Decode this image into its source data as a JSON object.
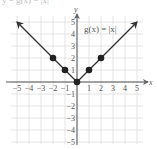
{
  "header": {
    "cropped_text": "y = g(x) = |x|"
  },
  "chart_data": {
    "type": "line",
    "title": "",
    "function_label": "g(x) = |x|",
    "xlabel": "x",
    "ylabel": "y",
    "xlim": [
      -5,
      5
    ],
    "ylim": [
      -5,
      5
    ],
    "grid": true,
    "x_ticks": [
      -5,
      -4,
      -3,
      -2,
      -1,
      1,
      2,
      3,
      4,
      5
    ],
    "y_ticks": [
      5,
      4,
      3,
      2,
      1,
      -1,
      -2,
      -3,
      -4,
      -5
    ],
    "x_tick_labels": [
      "−5",
      "−4",
      "−3",
      "−2",
      "−1",
      "1",
      "2",
      "3",
      "4",
      "5"
    ],
    "y_tick_labels": [
      "5",
      "4",
      "3",
      "2",
      "1",
      "−1",
      "−2",
      "−3",
      "−4",
      "−5"
    ],
    "series": [
      {
        "name": "g(x) = |x|",
        "x": [
          -5,
          -2,
          -1,
          0,
          1,
          2,
          5
        ],
        "y": [
          5,
          2,
          1,
          0,
          1,
          2,
          5
        ],
        "arrows_at_ends": true
      }
    ],
    "points": [
      {
        "x": -2,
        "y": 2
      },
      {
        "x": -1,
        "y": 1
      },
      {
        "x": 0,
        "y": 0
      },
      {
        "x": 1,
        "y": 1
      },
      {
        "x": 2,
        "y": 2
      }
    ],
    "colors": {
      "line": "#333333",
      "grid": "#dddddd",
      "axis": "#555555",
      "point": "#222222"
    }
  }
}
